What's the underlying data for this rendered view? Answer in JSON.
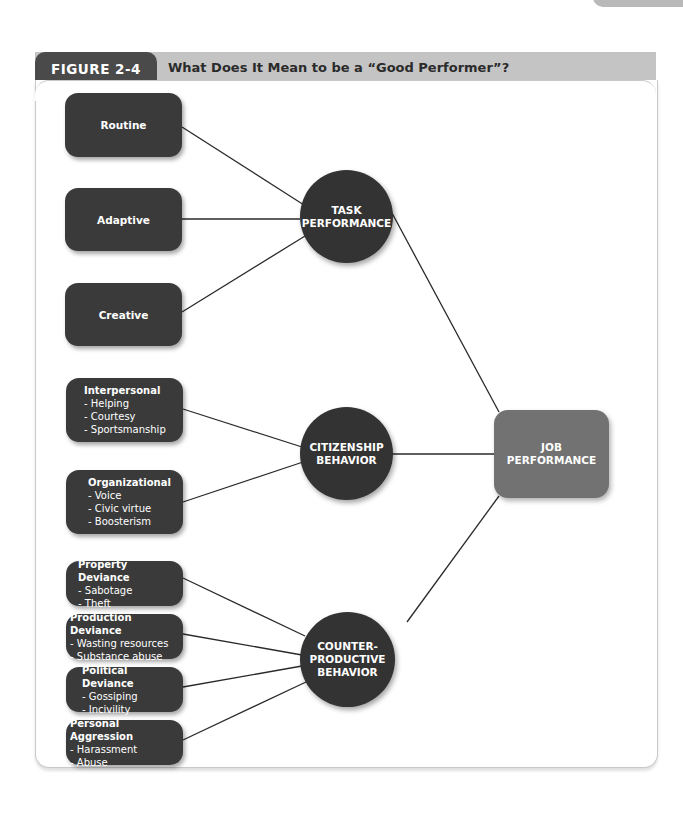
{
  "figure": {
    "label": "FIGURE 2-4",
    "title": "What Does It Mean to be a “Good Performer”?"
  },
  "colors": {
    "node_dark": "#3a3a3a",
    "circle": "#333333",
    "outcome": "#727272",
    "header_bar": "#c4c4c4",
    "label_tab": "#4a4a4a"
  },
  "outcome": {
    "line1": "JOB",
    "line2": "PERFORMANCE"
  },
  "categories": [
    {
      "id": "task",
      "line1": "TASK",
      "line2": "PERFORMANCE",
      "line3": ""
    },
    {
      "id": "citizenship",
      "line1": "CITIZENSHIP",
      "line2": "BEHAVIOR",
      "line3": ""
    },
    {
      "id": "counterproductive",
      "line1": "COUNTER-",
      "line2": "PRODUCTIVE",
      "line3": "BEHAVIOR"
    }
  ],
  "task_items": [
    {
      "label": "Routine"
    },
    {
      "label": "Adaptive"
    },
    {
      "label": "Creative"
    }
  ],
  "citizenship_items": [
    {
      "title": "Interpersonal",
      "items": [
        "- Helping",
        "- Courtesy",
        "- Sportsmanship"
      ]
    },
    {
      "title": "Organizational",
      "items": [
        "- Voice",
        "- Civic virtue",
        "- Boosterism"
      ]
    }
  ],
  "counterproductive_items": [
    {
      "title": "Property Deviance",
      "items": [
        "- Sabotage",
        "- Theft"
      ]
    },
    {
      "title": "Production Deviance",
      "items": [
        "- Wasting resources",
        "- Substance abuse"
      ]
    },
    {
      "title": "Political Deviance",
      "items": [
        "- Gossiping",
        "- Incivility"
      ]
    },
    {
      "title": "Personal Aggression",
      "items": [
        "- Harassment",
        "- Abuse"
      ]
    }
  ]
}
